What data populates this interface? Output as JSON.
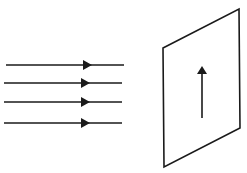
{
  "diagram": {
    "stroke_color": "#1a1a1a",
    "background": "#ffffff",
    "field_lines": [
      {
        "y": 65,
        "x1": 6,
        "x2": 124,
        "arrow_x": 88
      },
      {
        "y": 83,
        "x1": 4,
        "x2": 122,
        "arrow_x": 86
      },
      {
        "y": 102,
        "x1": 4,
        "x2": 122,
        "arrow_x": 86
      },
      {
        "y": 123,
        "x1": 4,
        "x2": 122,
        "arrow_x": 86
      }
    ],
    "plane": {
      "points": "163,48 239,9 240,128 164,167"
    },
    "plane_arrow": {
      "x": 202,
      "y1": 118,
      "y2": 67,
      "direction": "up"
    }
  }
}
